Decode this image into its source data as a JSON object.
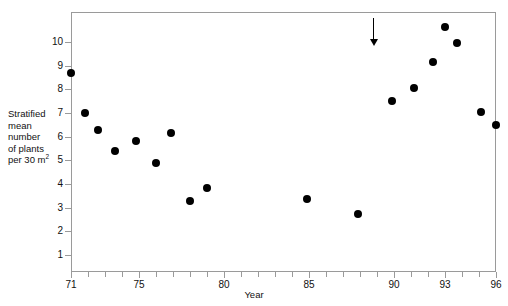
{
  "chart_data": {
    "type": "scatter",
    "title": "",
    "xlabel": "Year",
    "ylabel": "Stratified mean number of plants per 30 m²",
    "ylabel_lines": [
      "Stratified",
      "mean",
      "number",
      "of plants",
      "per 30 m²"
    ],
    "ylabel_unit_base": "per 30 m",
    "ylabel_unit_sup": "2",
    "xlim": [
      71,
      96
    ],
    "ylim": [
      0.1,
      11.0
    ],
    "grid": false,
    "legend": null,
    "xticks_all": [
      71,
      72,
      73,
      74,
      75,
      76,
      77,
      78,
      79,
      80,
      81,
      82,
      83,
      84,
      85,
      86,
      87,
      88,
      89,
      90,
      91,
      92,
      93,
      94,
      95,
      96
    ],
    "xtick_labels": [
      {
        "value": 71,
        "label": "71"
      },
      {
        "value": 75,
        "label": "75"
      },
      {
        "value": 80,
        "label": "80"
      },
      {
        "value": 85,
        "label": "85"
      },
      {
        "value": 90,
        "label": "90"
      },
      {
        "value": 93,
        "label": "93"
      },
      {
        "value": 96,
        "label": "96"
      }
    ],
    "yticks_all": [
      1,
      2,
      3,
      4,
      5,
      6,
      7,
      8,
      9,
      10
    ],
    "ytick_labels": [
      {
        "value": 10,
        "label": "10"
      },
      {
        "value": 9,
        "label": "9"
      },
      {
        "value": 8,
        "label": "8"
      },
      {
        "value": 7,
        "label": "7"
      },
      {
        "value": 6,
        "label": "6"
      },
      {
        "value": 5,
        "label": "5"
      },
      {
        "value": 4,
        "label": "4"
      },
      {
        "value": 3,
        "label": "3"
      },
      {
        "value": 2,
        "label": "2"
      },
      {
        "value": 1,
        "label": "1"
      }
    ],
    "series": [
      {
        "name": "Stratified mean number of plants per 30 m2",
        "marker": "filled-circle",
        "color": "#000000",
        "points": [
          {
            "x": 71.0,
            "y": 8.7
          },
          {
            "x": 71.8,
            "y": 7.0
          },
          {
            "x": 72.6,
            "y": 6.3
          },
          {
            "x": 73.6,
            "y": 5.4
          },
          {
            "x": 74.8,
            "y": 5.8
          },
          {
            "x": 76.0,
            "y": 4.9
          },
          {
            "x": 76.9,
            "y": 6.15
          },
          {
            "x": 78.0,
            "y": 3.3
          },
          {
            "x": 79.0,
            "y": 3.85
          },
          {
            "x": 84.9,
            "y": 3.35
          },
          {
            "x": 87.9,
            "y": 2.75
          },
          {
            "x": 89.9,
            "y": 7.5
          },
          {
            "x": 91.2,
            "y": 8.05
          },
          {
            "x": 92.3,
            "y": 9.15
          },
          {
            "x": 93.0,
            "y": 10.65
          },
          {
            "x": 93.7,
            "y": 9.95
          },
          {
            "x": 95.1,
            "y": 7.05
          },
          {
            "x": 96.0,
            "y": 6.5
          }
        ]
      }
    ],
    "annotations": [
      {
        "type": "arrow",
        "direction": "down",
        "x": 88.8,
        "y_top": 11.0,
        "y_tip": 9.85,
        "color": "#000000",
        "label": ""
      }
    ]
  },
  "colors": {
    "marker": "#000000",
    "axis": "#9a9a9a",
    "text": "#111111",
    "background": "#ffffff"
  }
}
